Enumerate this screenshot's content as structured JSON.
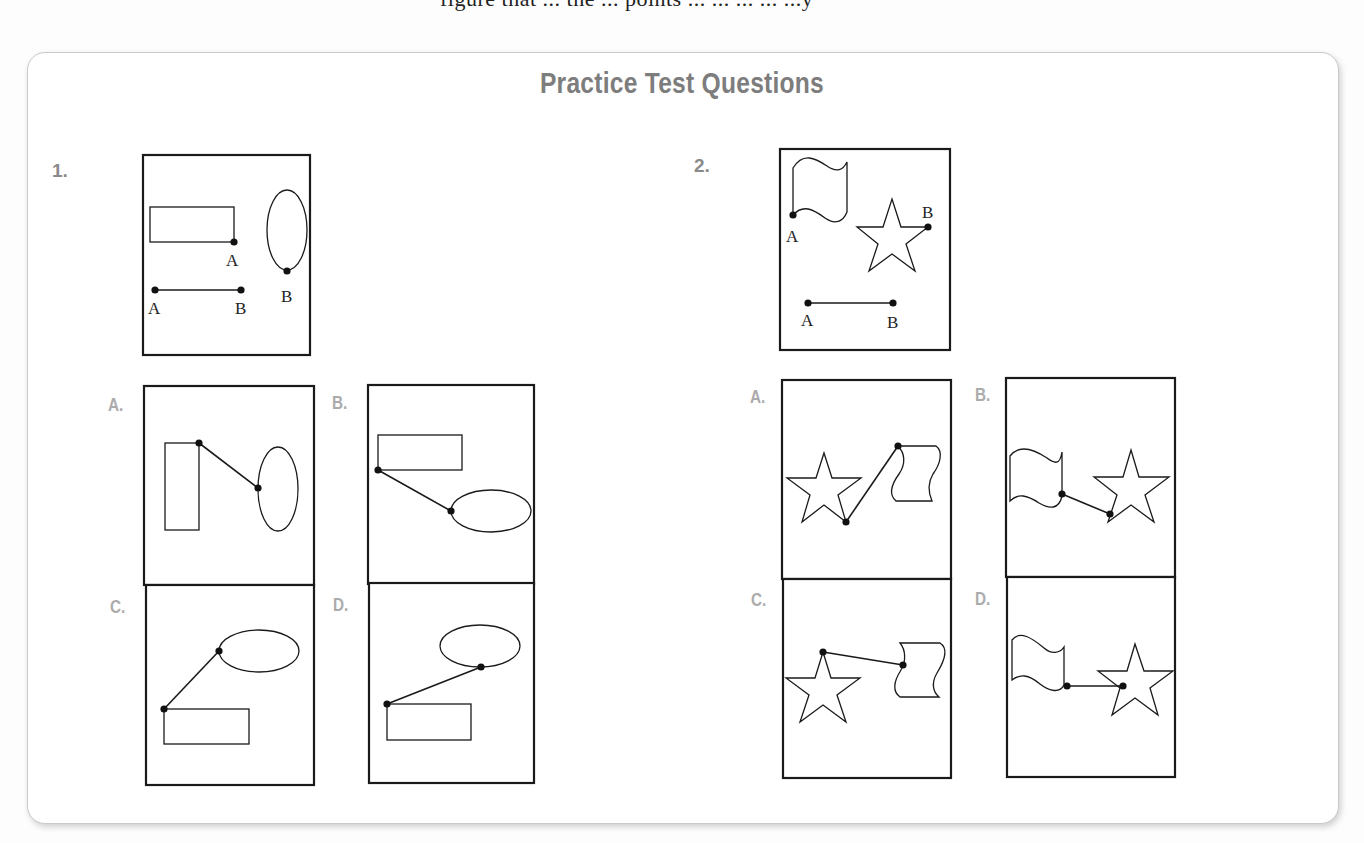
{
  "page_fragment_top": "figure that ... the ... points ... ... ... ... ...y",
  "title": "Practice Test Questions",
  "questions": [
    {
      "number": "1.",
      "prompt_figure": {
        "shapes": [
          "rectangle with point A",
          "ellipse with point B",
          "segment AB"
        ],
        "labels": {
          "rect_point": "A",
          "ellipse_point": "B",
          "seg_start": "A",
          "seg_end": "B"
        }
      },
      "options": [
        {
          "letter": "A.",
          "description": "tall rectangle joined at top-right corner to left side of vertical ellipse"
        },
        {
          "letter": "B.",
          "description": "rectangle joined at bottom-left corner to left side of horizontal ellipse"
        },
        {
          "letter": "C.",
          "description": "rectangle top-left corner joined to left side of horizontal ellipse above"
        },
        {
          "letter": "D.",
          "description": "rectangle top-left corner joined to bottom of horizontal ellipse above"
        }
      ]
    },
    {
      "number": "2.",
      "prompt_figure": {
        "shapes": [
          "flag with point A",
          "star with point B",
          "segment AB"
        ],
        "labels": {
          "flag_point": "A",
          "star_point": "B",
          "seg_start": "A",
          "seg_end": "B"
        }
      },
      "options": [
        {
          "letter": "A.",
          "description": "star bottom point joined to top-left corner of flag"
        },
        {
          "letter": "B.",
          "description": "flag bottom-right joined to bottom-left point of star"
        },
        {
          "letter": "C.",
          "description": "star top point joined to left side of flag"
        },
        {
          "letter": "D.",
          "description": "flag bottom-right joined horizontally to star interior right point"
        }
      ]
    }
  ],
  "colors": {
    "title": "#7d7d7d",
    "question_number": "#8a8a8a",
    "option_letter": "#ababab",
    "stroke": "#1a1a1a",
    "panel_border": "#c9c9c9"
  }
}
